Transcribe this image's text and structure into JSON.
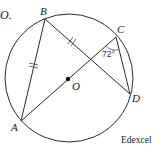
{
  "diagram": {
    "header_text": "O.",
    "source_label": "Edexcel",
    "circle": {
      "cx": 69,
      "cy": 78,
      "r": 64,
      "center_label": "O"
    },
    "points": {
      "A": {
        "label": "A",
        "x": 21,
        "y": 121
      },
      "B": {
        "label": "B",
        "x": 45,
        "y": 19
      },
      "C": {
        "label": "C",
        "x": 116,
        "y": 37
      },
      "D": {
        "label": "D",
        "x": 130,
        "y": 94
      },
      "O": {
        "label": "O",
        "x": 68,
        "y": 79
      }
    },
    "segments": [
      "AB",
      "BD",
      "AC",
      "CD"
    ],
    "equal_marks": [
      "AB",
      "BD"
    ],
    "angle": {
      "vertex": "C",
      "between": [
        "CA",
        "CD"
      ],
      "label": "72°"
    },
    "colors": {
      "stroke": "#2a2a2a",
      "background": "#ffffff"
    }
  }
}
